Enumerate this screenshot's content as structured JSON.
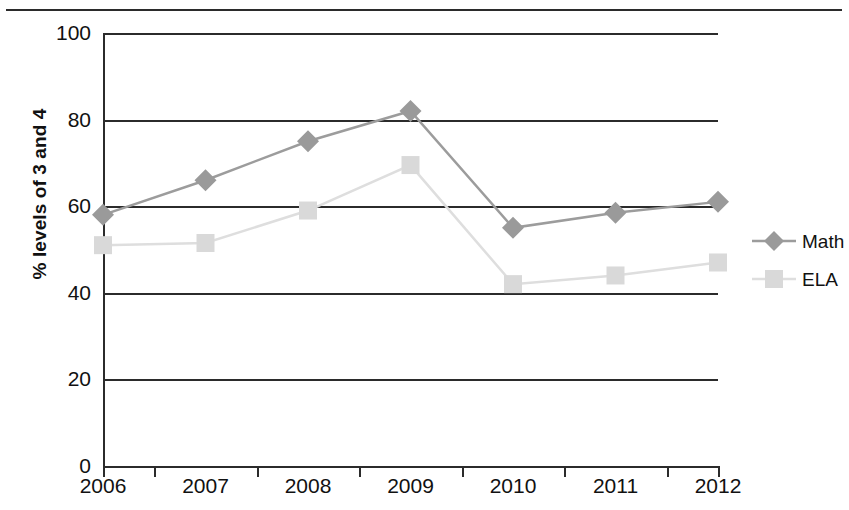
{
  "chart_data": {
    "type": "line",
    "title": "",
    "xlabel": "",
    "ylabel": "% levels of 3 and 4",
    "categories": [
      "2006",
      "2007",
      "2008",
      "2009",
      "2010",
      "2011",
      "2012"
    ],
    "ylim": [
      0,
      100
    ],
    "yticks": [
      0,
      20,
      40,
      60,
      80,
      100
    ],
    "ytick_labels": [
      "0",
      "20",
      "40",
      "60",
      "80",
      "100"
    ],
    "grid": true,
    "legend_position": "right",
    "series": [
      {
        "name": "Math",
        "marker": "diamond",
        "color": "#9a9a9a",
        "line_color": "#9c9c9c",
        "values": [
          58,
          66,
          75,
          82,
          55,
          58.5,
          61
        ]
      },
      {
        "name": "ELA",
        "marker": "square",
        "color": "#d9d9d9",
        "line_color": "#dedede",
        "values": [
          51,
          51.5,
          59,
          69.5,
          42,
          44,
          47
        ]
      }
    ]
  },
  "legend": {
    "items": [
      {
        "label": "Math"
      },
      {
        "label": "ELA"
      }
    ]
  },
  "colors": {
    "axis": "#2b2b2b",
    "math": "#9a9a9a",
    "ela": "#d9d9d9",
    "background": "#ffffff"
  }
}
